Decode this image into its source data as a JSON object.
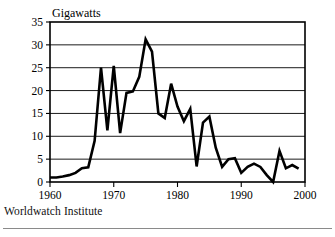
{
  "figure": {
    "unit_label": "Gigawatts",
    "source_note": "Worldwatch Institute"
  },
  "chart_data": {
    "type": "line",
    "title": "",
    "subtitle": "",
    "xlabel": "",
    "ylabel": "Gigawatts",
    "xlim": [
      1960,
      2000
    ],
    "ylim": [
      0,
      35
    ],
    "grid": "horizontal",
    "legend": "none",
    "line_color": "#000000",
    "xticks": [
      1960,
      1970,
      1980,
      1990,
      2000
    ],
    "xtick_labels": [
      "1960",
      "1970",
      "1980",
      "1990",
      "2000"
    ],
    "yticks": [
      0,
      5,
      10,
      15,
      20,
      25,
      30,
      35
    ],
    "ytick_labels": [
      "0",
      "5",
      "10",
      "15",
      "20",
      "25",
      "30",
      "35"
    ],
    "x": [
      1960,
      1961,
      1962,
      1963,
      1964,
      1965,
      1966,
      1967,
      1968,
      1969,
      1970,
      1971,
      1972,
      1973,
      1974,
      1975,
      1976,
      1977,
      1978,
      1979,
      1980,
      1981,
      1982,
      1983,
      1984,
      1985,
      1986,
      1987,
      1988,
      1989,
      1990,
      1991,
      1992,
      1993,
      1994,
      1995,
      1996,
      1997,
      1998,
      1999
    ],
    "values": [
      1.0,
      1.0,
      1.2,
      1.5,
      2.0,
      3.0,
      3.2,
      9.0,
      25.0,
      11.3,
      25.4,
      10.7,
      19.5,
      19.8,
      23.0,
      31.2,
      28.5,
      15.0,
      14.0,
      21.5,
      16.5,
      13.3,
      16.0,
      3.4,
      13.0,
      14.3,
      7.5,
      3.3,
      5.0,
      5.2,
      2.0,
      3.3,
      4.0,
      3.3,
      1.5,
      0.0,
      6.8,
      3.0,
      3.7,
      2.9
    ],
    "series": [
      {
        "name": "Annual nuclear capacity additions",
        "values": [
          1.0,
          1.0,
          1.2,
          1.5,
          2.0,
          3.0,
          3.2,
          9.0,
          25.0,
          11.3,
          25.4,
          10.7,
          19.5,
          19.8,
          23.0,
          31.2,
          28.5,
          15.0,
          14.0,
          21.5,
          16.5,
          13.3,
          16.0,
          3.4,
          13.0,
          14.3,
          7.5,
          3.3,
          5.0,
          5.2,
          2.0,
          3.3,
          4.0,
          3.3,
          1.5,
          0.0,
          6.8,
          3.0,
          3.7,
          2.9
        ]
      }
    ],
    "annotations": []
  }
}
